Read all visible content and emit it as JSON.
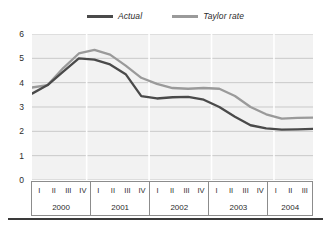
{
  "legend": {
    "position": "top-center",
    "items": [
      {
        "label": "Actual",
        "color": "#4a4a4a",
        "swatch_name": "legend-swatch-actual"
      },
      {
        "label": "Taylor rate",
        "color": "#9a9a9a",
        "swatch_name": "legend-swatch-taylor-rate"
      }
    ]
  },
  "axes": {
    "y_ticks": [
      "6",
      "5",
      "4",
      "3",
      "2",
      "1",
      "0"
    ],
    "x_years": [
      {
        "year": "2000",
        "quarters": [
          "I",
          "II",
          "III",
          "IV"
        ]
      },
      {
        "year": "2001",
        "quarters": [
          "I",
          "II",
          "III",
          "IV"
        ]
      },
      {
        "year": "2002",
        "quarters": [
          "I",
          "II",
          "III",
          "IV"
        ]
      },
      {
        "year": "2003",
        "quarters": [
          "I",
          "II",
          "III",
          "IV"
        ]
      },
      {
        "year": "2004",
        "quarters": [
          "I",
          "II",
          "III"
        ]
      }
    ]
  },
  "colors": {
    "actual": "#4a4a4a",
    "taylor_rate": "#9a9a9a",
    "plot_background": "#f2f2f2",
    "gridline": "#c9c9c9",
    "axis_border": "#8c8c8c",
    "bottom_rule": "#3a3a3a",
    "text": "#2b2b2b"
  },
  "chart_data": {
    "type": "line",
    "title": "",
    "subtitle": "",
    "xlabel": "",
    "ylabel": "",
    "ylim": [
      0,
      6
    ],
    "ytick_step": 1,
    "grid": true,
    "legend_position": "top-center",
    "categories": [
      "2000 I",
      "2000 II",
      "2000 III",
      "2000 IV",
      "2001 I",
      "2001 II",
      "2001 III",
      "2001 IV",
      "2002 I",
      "2002 II",
      "2002 III",
      "2002 IV",
      "2003 I",
      "2003 II",
      "2003 III",
      "2003 IV",
      "2004 I",
      "2004 II",
      "2004 III"
    ],
    "series": [
      {
        "name": "Actual",
        "color": "#4a4a4a",
        "values": [
          3.55,
          3.9,
          4.45,
          5.0,
          4.95,
          4.75,
          4.35,
          3.45,
          3.35,
          3.4,
          3.42,
          3.3,
          3.0,
          2.6,
          2.25,
          2.12,
          2.07,
          2.08,
          2.1
        ]
      },
      {
        "name": "Taylor rate",
        "color": "#9a9a9a",
        "values": [
          3.8,
          3.9,
          4.6,
          5.2,
          5.35,
          5.15,
          4.7,
          4.2,
          3.95,
          3.78,
          3.75,
          3.78,
          3.75,
          3.45,
          3.0,
          2.7,
          2.52,
          2.55,
          2.56
        ]
      }
    ]
  }
}
